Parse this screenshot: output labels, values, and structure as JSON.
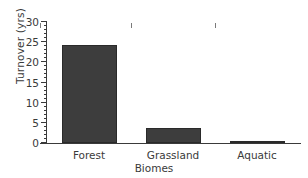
{
  "chart_data": {
    "type": "bar",
    "title": "",
    "subtitle": "",
    "categories": [
      "Forest",
      "Grassland",
      "Aquatic"
    ],
    "values": [
      24.2,
      3.6,
      0.4
    ],
    "xlabel": "Biomes",
    "ylabel": "Turnover (yrs)",
    "ylim": [
      0,
      30
    ],
    "xlim": [
      0,
      3
    ],
    "y_major_ticks": [
      0,
      5,
      10,
      15,
      20,
      25,
      30
    ],
    "y_tick_labels": [
      "0",
      "5",
      "10",
      "15",
      "20",
      "25",
      "30"
    ],
    "y_minor_tick_interval": 1,
    "grid": false,
    "legend": null,
    "legend_position": "none",
    "orientation": "vertical",
    "bar_color": "#3d3d3d",
    "bar_edge_color": "#2a2a2a",
    "axis_color": "#3a3a3a",
    "background_color": "#ffffff",
    "annotations": []
  },
  "axes": {
    "y_title": "Turnover (yrs)",
    "x_title": "Biomes"
  }
}
